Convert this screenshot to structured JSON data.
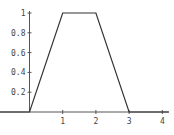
{
  "chart_data": {
    "type": "line",
    "title": "",
    "xlabel": "",
    "ylabel": "",
    "xlim": [
      -0.9,
      4.2
    ],
    "ylim": [
      0,
      1.0
    ],
    "grid": false,
    "legend": null,
    "x_ticks": [
      1,
      2,
      3,
      4
    ],
    "x_tick_labels": [
      "1",
      "2",
      "3",
      "4"
    ],
    "y_ticks": [
      0.2,
      0.4,
      0.6,
      0.8,
      1
    ],
    "y_tick_labels": [
      "0.2",
      "0.4",
      "0.6",
      "0.8",
      "1"
    ],
    "series": [
      {
        "name": "trapezoid",
        "x": [
          -0.9,
          0,
          1,
          2,
          3,
          4.2
        ],
        "y": [
          0,
          0,
          1,
          1,
          0,
          0
        ]
      }
    ]
  }
}
